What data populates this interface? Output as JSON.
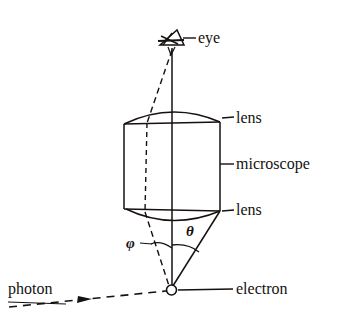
{
  "figure": {
    "width": 350,
    "height": 322,
    "background_color": "#ffffff",
    "ink_color": "#15110f"
  },
  "labels": {
    "eye": "eye",
    "lens_top": "lens",
    "microscope": "microscope",
    "lens_bottom": "lens",
    "electron": "electron",
    "photon": "photon",
    "theta": "θ",
    "phi": "φ"
  },
  "elements": {
    "eye_icon": "eye-sketch-icon",
    "electron_marker": "small-open-circle",
    "photon_ray_style": "dashed-with-arrowhead",
    "scattered_ray_style": "dashed",
    "aperture_ray_style": "solid",
    "hidden_edge_style": "dashed"
  },
  "geometry": {
    "eye_point": [
      172,
      48
    ],
    "electron_point": [
      171,
      290
    ],
    "cylinder_left": 124,
    "cylinder_right": 220,
    "cylinder_top": 124,
    "cylinder_bottom": 209,
    "top_lens_apex_y": 112,
    "bottom_lens_apex_y": 219,
    "photon_arrow_start": [
      9,
      307
    ],
    "photon_arrow_end": [
      168,
      291
    ],
    "theta_arc_label_pos": [
      192,
      232
    ],
    "phi_arc_label_pos": [
      133,
      244
    ]
  }
}
